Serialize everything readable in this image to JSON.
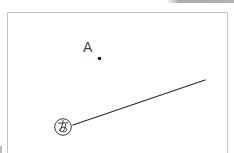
{
  "canvas": {
    "description": "blank drawing canvas with one labeled point and one marked line segment",
    "border_color": "#c6c6c6",
    "background_color": "#ffffff",
    "ink_color": "#2d2d2d"
  },
  "figure": {
    "point": {
      "label": "A"
    },
    "segment": {
      "marker_label": "あ"
    }
  },
  "cropped_elements": {
    "top_right_toolbar_edge_color": "#ababab",
    "bottom_left_sliver_color": "#bdbdbd"
  }
}
